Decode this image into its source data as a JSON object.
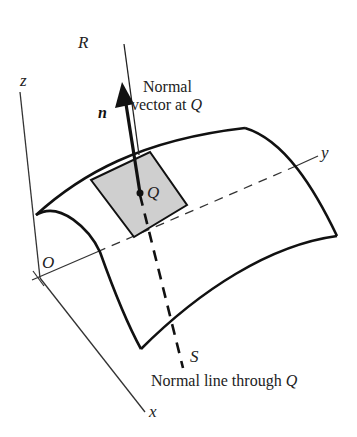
{
  "diagram": {
    "labels": {
      "z_axis": "z",
      "y_axis": "y",
      "x_axis": "x",
      "origin": "O",
      "point_R": "R",
      "point_S": "S",
      "point_Q": "Q",
      "normal_vector_symbol": "n",
      "normal_vector_caption_line1": "Normal",
      "normal_vector_caption_line2_prefix": "vector at ",
      "normal_vector_caption_line2_point": "Q",
      "normal_line_caption_prefix": "Normal line through ",
      "normal_line_caption_point": "Q"
    },
    "colors": {
      "stroke": "#111111",
      "axis": "#333333",
      "tangent_patch_fill": "#cfcfcf",
      "background": "#ffffff"
    }
  }
}
